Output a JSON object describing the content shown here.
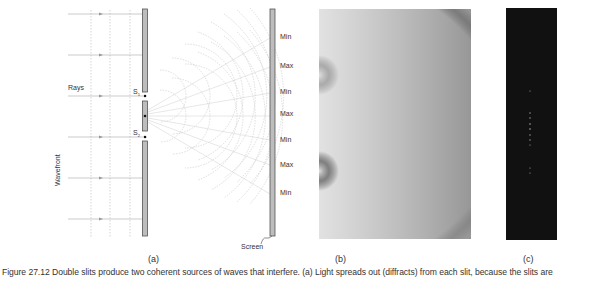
{
  "figure": {
    "panel_a": {
      "sublabel": "(a)",
      "labels": {
        "rays": "Rays",
        "wavefront": "Wavefront",
        "s1": "S",
        "s1_sub": "1",
        "s2": "S",
        "s2_sub": "2",
        "screen": "Screen"
      },
      "screen_marks": [
        "Min",
        "Max",
        "Min",
        "Max",
        "Min",
        "Max",
        "Min"
      ]
    },
    "panel_b": {
      "sublabel": "(b)"
    },
    "panel_c": {
      "sublabel": "(c)"
    },
    "caption": "Figure 27.12 Double slits produce two coherent sources of waves that interfere. (a) Light spreads out (diffracts) from each slit, because the slits are"
  }
}
